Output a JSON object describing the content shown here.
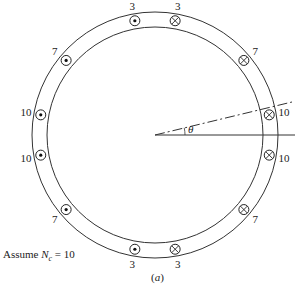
{
  "figure": {
    "caption": "(a)",
    "note_prefix": "Assume ",
    "note_var": "N",
    "note_sub": "c",
    "note_suffix": " = 10",
    "angle_label": "θ",
    "geometry": {
      "cx": 155,
      "cy": 135,
      "outer_r": 123,
      "inner_r": 108,
      "conductor_r": 116
    },
    "conductors": [
      {
        "angle_deg": 10,
        "type": "cross",
        "label": "10"
      },
      {
        "angle_deg": -10,
        "type": "cross",
        "label": "10"
      },
      {
        "angle_deg": -40,
        "type": "cross",
        "label": "7"
      },
      {
        "angle_deg": -80,
        "type": "cross",
        "label": "3"
      },
      {
        "angle_deg": 40,
        "type": "cross",
        "label": "7"
      },
      {
        "angle_deg": 80,
        "type": "cross",
        "label": "3"
      },
      {
        "angle_deg": 100,
        "type": "dot",
        "label": "3"
      },
      {
        "angle_deg": 140,
        "type": "dot",
        "label": "7"
      },
      {
        "angle_deg": 170,
        "type": "dot",
        "label": "10"
      },
      {
        "angle_deg": 190,
        "type": "dot",
        "label": "10"
      },
      {
        "angle_deg": 220,
        "type": "dot",
        "label": "7"
      },
      {
        "angle_deg": 260,
        "type": "dot",
        "label": "3"
      }
    ]
  }
}
